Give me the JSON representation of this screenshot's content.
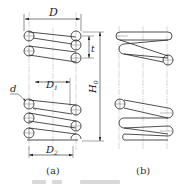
{
  "figure": {
    "type": "engineering-drawing",
    "panels": [
      {
        "id": "a",
        "label": "(a)"
      },
      {
        "id": "b",
        "label": "(b)"
      }
    ],
    "dimensions": {
      "D": "D",
      "D1": "D",
      "D1_sub": "1",
      "D2": "D",
      "D2_sub": "2",
      "d": "d",
      "t": "t",
      "H0": "H",
      "H0_sub": "0"
    },
    "caption": "图 ... 圆柱螺旋弹簧"
  },
  "colors": {
    "line": "#222222",
    "centerline": "#888888",
    "background": "#ffffff"
  }
}
